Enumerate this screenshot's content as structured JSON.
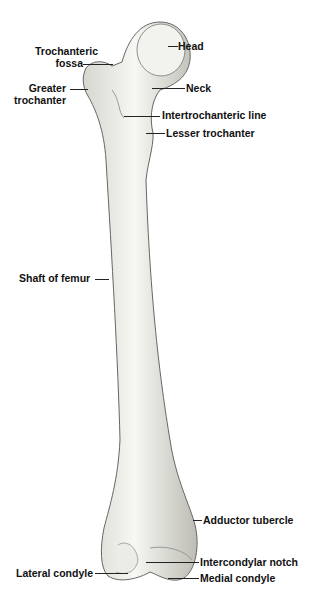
{
  "figure": {
    "labels": {
      "head": "Head",
      "trochanteric_fossa_1": "Trochanteric",
      "trochanteric_fossa_2": "fossa",
      "greater_trochanter_1": "Greater",
      "greater_trochanter_2": "trochanter",
      "neck": "Neck",
      "intertrochanteric_line": "Intertrochanteric line",
      "lesser_trochanter": "Lesser trochanter",
      "shaft": "Shaft of femur",
      "adductor_tubercle": "Adductor tubercle",
      "intercondylar_notch": "Intercondylar notch",
      "lateral_condyle": "Lateral condyle",
      "medial_condyle": "Medial condyle"
    },
    "colors": {
      "bone_light": "#f4f4f0",
      "bone_shade": "#c9c9c2",
      "outline": "#555555",
      "text": "#111111"
    }
  }
}
